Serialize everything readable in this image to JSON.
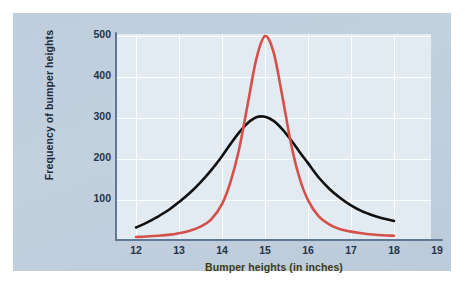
{
  "chart_data": {
    "type": "line",
    "title": "",
    "xlabel": "Bumper heights (in inches)",
    "ylabel": "Frequency of bumper heights",
    "xlim": [
      11.6,
      19.3
    ],
    "ylim": [
      0,
      520
    ],
    "xticks": [
      "12",
      "13",
      "14",
      "15",
      "16",
      "17",
      "18",
      "19"
    ],
    "yticks": [
      "100",
      "200",
      "300",
      "400",
      "500"
    ],
    "grid": true,
    "legend": "none",
    "series": [
      {
        "name": "narrow-distribution",
        "color": "#d6504a",
        "x": [
          12.0,
          12.25,
          12.5,
          12.75,
          13.0,
          13.25,
          13.5,
          13.75,
          14.0,
          14.2,
          14.4,
          14.6,
          14.8,
          15.0,
          15.2,
          15.4,
          15.6,
          15.8,
          16.0,
          16.25,
          16.5,
          16.75,
          17.0,
          17.25,
          17.5,
          17.75,
          18.0
        ],
        "values": [
          5,
          6,
          8,
          10,
          14,
          20,
          30,
          48,
          85,
          140,
          220,
          330,
          440,
          495,
          455,
          350,
          235,
          150,
          95,
          55,
          35,
          24,
          18,
          14,
          11,
          9,
          8
        ]
      },
      {
        "name": "wide-distribution",
        "color": "#111111",
        "x": [
          12.0,
          12.25,
          12.5,
          12.75,
          13.0,
          13.25,
          13.5,
          13.75,
          14.0,
          14.2,
          14.4,
          14.6,
          14.8,
          15.0,
          15.2,
          15.4,
          15.6,
          15.8,
          16.0,
          16.25,
          16.5,
          16.75,
          17.0,
          17.25,
          17.5,
          17.75,
          18.0
        ],
        "values": [
          28,
          40,
          54,
          70,
          90,
          112,
          138,
          168,
          202,
          232,
          260,
          283,
          297,
          298,
          288,
          268,
          242,
          213,
          185,
          150,
          122,
          100,
          82,
          68,
          58,
          50,
          44
        ]
      }
    ]
  },
  "axes": {
    "y_title": "Frequency of bumper heights",
    "x_title": "Bumper heights (in inches)",
    "y_tick_labels": [
      "500",
      "400",
      "300",
      "200",
      "100"
    ],
    "x_tick_labels": [
      "12",
      "13",
      "14",
      "15",
      "16",
      "17",
      "18",
      "19"
    ]
  },
  "colors": {
    "page_background": "#ffffff",
    "panel_background": "#c0cedd",
    "plot_background": "#e2eaf2",
    "gridline": "#ffffff",
    "axis_line": "#5f7894",
    "red_curve": "#d6504a",
    "black_curve": "#111111",
    "y_title_text": "#1d2b3a",
    "x_title_text": "#3b3a16",
    "tick_text": "#243447"
  }
}
